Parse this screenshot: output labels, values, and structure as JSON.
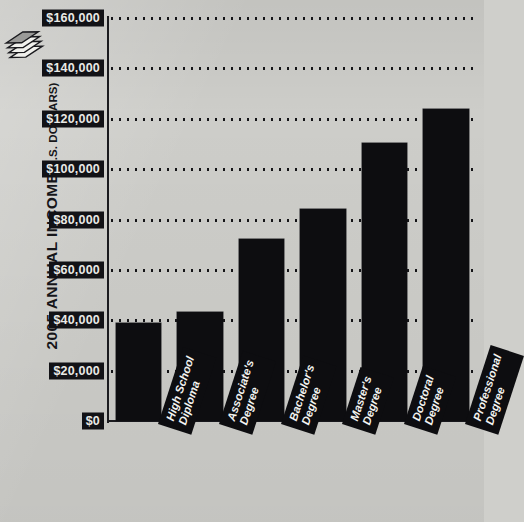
{
  "axis_title": {
    "main": "2005 ANNUAL INCOME",
    "unit": "(U.S. DOLLARS)"
  },
  "icons": {
    "money_stack": "money-stack-icon"
  },
  "colors": {
    "background": "#cdcdc9",
    "bar": "#0d0d10",
    "axis": "#1b1b1f",
    "label_text": "#e9e9e6"
  },
  "chart_data": {
    "type": "bar",
    "xlabel": "",
    "ylabel": "2005 ANNUAL INCOME (U.S. DOLLARS)",
    "ylim": [
      0,
      160000
    ],
    "ytick_step": 20000,
    "grid": true,
    "legend": false,
    "categories": [
      "High School Diploma",
      "Associate's Degree",
      "Bachelor's Degree",
      "Master's Degree",
      "Doctoral Degree",
      "Professional Degree"
    ],
    "category_lines": [
      [
        "High School",
        "Diploma"
      ],
      [
        "Associate's",
        "Degree"
      ],
      [
        "Bachelor's",
        "Degree"
      ],
      [
        "Master's",
        "Degree"
      ],
      [
        "Doctoral",
        "Degree"
      ],
      [
        "Professional",
        "Degree"
      ]
    ],
    "values": [
      38800,
      43200,
      72400,
      84000,
      110400,
      124000
    ],
    "ytick_labels": [
      "$160,000",
      "$140,000",
      "$120,000",
      "$100,000",
      "$80,000",
      "$60,000",
      "$40,000",
      "$20,000",
      "$0"
    ],
    "ytick_values": [
      160000,
      140000,
      120000,
      100000,
      80000,
      60000,
      40000,
      20000,
      0
    ]
  }
}
